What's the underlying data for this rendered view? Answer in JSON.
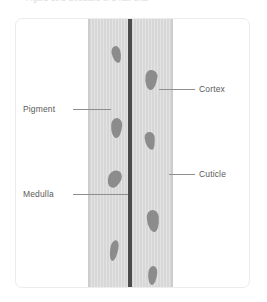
{
  "top_caption": {
    "text": "Figure 10.3  Structure of a hair shaft"
  },
  "figure": {
    "colors": {
      "cortex": "#d7d7d7",
      "cuticle": "#cdcdcd",
      "medulla": "#4c4c4c",
      "pigment": "#8c8c8c",
      "label_text": "#5a5a5a",
      "leader_line": "#8e8e8e",
      "card_border": "#ececed",
      "background": "#ffffff"
    },
    "labels": [
      {
        "id": "pigment",
        "text": "Pigment",
        "side": "left",
        "x": 22,
        "y": 103
      },
      {
        "id": "medulla",
        "text": "Medulla",
        "side": "left",
        "x": 22,
        "y": 188
      },
      {
        "id": "cortex",
        "text": "Cortex",
        "side": "right",
        "x": 198,
        "y": 83
      },
      {
        "id": "cuticle",
        "text": "Cuticle",
        "side": "right",
        "x": 198,
        "y": 168
      }
    ],
    "leaders": [
      {
        "id": "pigment-leader",
        "x": 72,
        "y": 108,
        "width": 38
      },
      {
        "id": "medulla-leader",
        "x": 72,
        "y": 193,
        "width": 55
      },
      {
        "id": "cortex-leader",
        "x": 158,
        "y": 88,
        "width": 36
      },
      {
        "id": "cuticle-leader",
        "x": 168,
        "y": 173,
        "width": 26
      }
    ],
    "granules": [
      {
        "id": "granule-1",
        "column": "left",
        "x": 24,
        "y": 28,
        "w": 9,
        "h": 17,
        "radius": "52% 48% 46% 54% / 38% 34% 66% 62%",
        "rotate": -12
      },
      {
        "id": "granule-2",
        "column": "right",
        "x": 57,
        "y": 52,
        "w": 12,
        "h": 20,
        "radius": "46% 54% 40% 60% / 32% 30% 70% 68%",
        "rotate": 8
      },
      {
        "id": "granule-3",
        "column": "left",
        "x": 23,
        "y": 100,
        "w": 11,
        "h": 20,
        "radius": "50% 50% 44% 56% / 36% 36% 64% 64%",
        "rotate": 4
      },
      {
        "id": "granule-4",
        "column": "right",
        "x": 57,
        "y": 114,
        "w": 10,
        "h": 18,
        "radius": "48% 52% 38% 62% / 30% 28% 72% 70%",
        "rotate": -6
      },
      {
        "id": "granule-5",
        "column": "left",
        "x": 20,
        "y": 152,
        "w": 13,
        "h": 18,
        "radius": "56% 44% 50% 50% / 44% 40% 60% 56%",
        "rotate": 22
      },
      {
        "id": "granule-6",
        "column": "right",
        "x": 59,
        "y": 192,
        "w": 12,
        "h": 22,
        "radius": "50% 50% 42% 58% / 34% 32% 68% 66%",
        "rotate": -4
      },
      {
        "id": "granule-7",
        "column": "left",
        "x": 22,
        "y": 222,
        "w": 8,
        "h": 21,
        "radius": "54% 46% 48% 52% / 40% 36% 64% 60%",
        "rotate": 10
      },
      {
        "id": "granule-8",
        "column": "right",
        "x": 60,
        "y": 248,
        "w": 9,
        "h": 19,
        "radius": "50% 50% 46% 54% / 36% 34% 66% 64%",
        "rotate": 6
      }
    ]
  }
}
